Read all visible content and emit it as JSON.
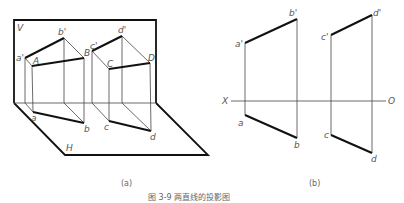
{
  "figure_a": {
    "caption": "(a)",
    "plane_v_label": "V",
    "plane_h_label": "H",
    "points": {
      "a_prime": "a'",
      "A": "A",
      "b_prime": "b'",
      "B": "B",
      "c_prime": "c'",
      "C": "C",
      "d_prime": "d'",
      "D": "D",
      "a": "a",
      "b": "b",
      "c": "c",
      "d": "d"
    }
  },
  "figure_b": {
    "caption": "(b)",
    "axis_x_label": "X",
    "axis_o_label": "O",
    "points": {
      "a_prime": "a'",
      "b_prime": "b'",
      "c_prime": "c'",
      "d_prime": "d'",
      "a": "a",
      "b": "b",
      "c": "c",
      "d": "d"
    }
  },
  "figure_caption": "图 3-9  两直线的投影图",
  "colors": {
    "line": "#111111",
    "thin_line": "#444444",
    "label": "#555555"
  }
}
